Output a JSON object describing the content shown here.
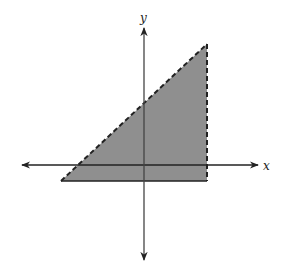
{
  "figure": {
    "type": "coordinate-plane-inequality-region",
    "axes": {
      "x_label": "x",
      "y_label": "y",
      "axis_color": "#222222"
    },
    "region": {
      "shape": "triangle",
      "fill_color": "#8f8f8f",
      "vertices_px": [
        [
          207,
          44
        ],
        [
          207,
          181
        ],
        [
          61,
          181
        ]
      ],
      "edges": [
        {
          "name": "slanted-boundary",
          "style": "dashed"
        },
        {
          "name": "vertical-boundary",
          "style": "dashed"
        },
        {
          "name": "horizontal-boundary",
          "style": "solid"
        }
      ]
    }
  }
}
